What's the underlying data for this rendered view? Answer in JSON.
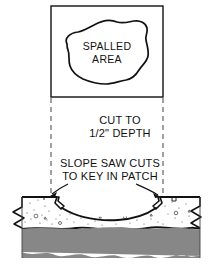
{
  "figure": {
    "kind": "construction-detail-drawing",
    "title_visible": false,
    "colors": {
      "ink": "#111111",
      "paper": "#ffffff",
      "stipple": "#3a3a3a",
      "hatch": "#2b2b2b"
    }
  },
  "plan_view": {
    "box": {
      "x": 51,
      "y": 6,
      "width": 112,
      "height": 91
    },
    "label_line1": "SPALLED",
    "label_line2": "AREA",
    "blob_name": "spalled-area-outline"
  },
  "annotations": {
    "cut_depth": {
      "line1": "CUT TO",
      "line2": "1/2\" DEPTH"
    },
    "slope_cuts": {
      "line1": "SLOPE SAW CUTS",
      "line2": "TO KEY IN PATCH"
    }
  },
  "projection_lines": {
    "left_x": 51,
    "right_x": 163,
    "top_y": 98,
    "bottom_y": 198,
    "style": "dashed"
  },
  "section_view": {
    "slab_top_y": 197,
    "slab_bottom_y": 228,
    "subgrade_top_y": 228,
    "subgrade_bottom_y": 258,
    "left_edge_x": 22,
    "right_edge_x": 200,
    "saw_cut_left_x": 57,
    "saw_cut_right_x": 160,
    "break_line_left": "zigzag",
    "break_line_right": "zigzag",
    "slab_material": "concrete-stipple",
    "subgrade_material": "earth-crosshatch"
  }
}
